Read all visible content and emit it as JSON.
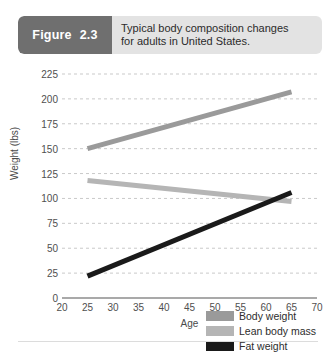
{
  "figure": {
    "badge_label": "Figure",
    "badge_number": "2.3",
    "caption_line1": "Typical body composition changes",
    "caption_line2": "for adults in United States."
  },
  "chart_data": {
    "type": "line",
    "title": "Typical body composition changes for adults in United States.",
    "xlabel": "Age",
    "ylabel": "Weight (lbs)",
    "xlim": [
      20,
      70
    ],
    "ylim": [
      0,
      225
    ],
    "xticks": [
      "20",
      "25",
      "30",
      "35",
      "40",
      "45",
      "50",
      "55",
      "60",
      "65",
      "70"
    ],
    "yticks": [
      "0",
      "25",
      "50",
      "75",
      "100",
      "125",
      "150",
      "175",
      "200",
      "225"
    ],
    "grid": "horizontal-dashed",
    "legend_position": "lower-right-inside",
    "series": [
      {
        "name": "Body weight",
        "color": "#9a9a9a",
        "x": [
          25,
          65
        ],
        "values": [
          150,
          207
        ]
      },
      {
        "name": "Lean body mass",
        "color": "#b5b5b5",
        "x": [
          25,
          65
        ],
        "values": [
          118,
          97
        ]
      },
      {
        "name": "Fat weight",
        "color": "#1a1a1a",
        "x": [
          25,
          65
        ],
        "values": [
          22,
          106
        ]
      }
    ]
  },
  "colors": {
    "badge_bg": "#6f6f6f",
    "header_bg": "#e3e3e3",
    "grid": "#c9c9c9",
    "axis": "#8d8d8d"
  }
}
